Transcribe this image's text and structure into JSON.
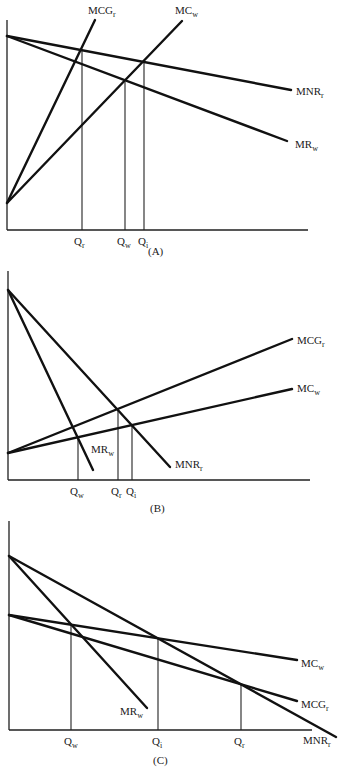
{
  "figure": {
    "panels": [
      {
        "id": "A",
        "caption": "(A)",
        "caption_pos": [
          148,
          255
        ],
        "axes": {
          "origin": [
            7,
            230
          ],
          "y_top": 20,
          "x_end": 308
        },
        "curves": [
          {
            "name": "MNR",
            "sub": "r",
            "from": [
              7,
              36
            ],
            "to": [
              291,
              90
            ],
            "label_pos": [
              296,
              95
            ]
          },
          {
            "name": "MR",
            "sub": "w",
            "from": [
              7,
              36
            ],
            "to": [
              287,
              141
            ],
            "label_pos": [
              295,
              148
            ]
          },
          {
            "name": "MCG",
            "sub": "r",
            "from": [
              7,
              203
            ],
            "to": [
              95,
              20
            ],
            "label_pos": [
              88,
              14
            ]
          },
          {
            "name": "MC",
            "sub": "w",
            "from": [
              7,
              203
            ],
            "to": [
              182,
              21
            ],
            "label_pos": [
              175,
              14
            ]
          }
        ],
        "drops": [
          {
            "x": 82,
            "y_top": 50,
            "name": "Q",
            "sub": "r",
            "label_pos": [
              74,
              245
            ]
          },
          {
            "x": 125,
            "y_top": 82,
            "name": "Q",
            "sub": "w",
            "label_pos": [
              117,
              245
            ]
          },
          {
            "x": 144,
            "y_top": 63,
            "name": "Q",
            "sub": "i",
            "label_pos": [
              138,
              245
            ]
          }
        ]
      },
      {
        "id": "B",
        "caption": "(B)",
        "caption_pos": [
          150,
          512
        ],
        "axes": {
          "origin": [
            8,
            480
          ],
          "y_top": 271,
          "x_end": 310
        },
        "curves": [
          {
            "name": "MR",
            "sub": "w",
            "from": [
              8,
              290
            ],
            "to": [
              93,
              470
            ],
            "label_pos": [
              91,
              453
            ]
          },
          {
            "name": "MNR",
            "sub": "r",
            "from": [
              8,
              290
            ],
            "to": [
              170,
              467
            ],
            "label_pos": [
              175,
              468
            ]
          },
          {
            "name": "MCG",
            "sub": "r",
            "from": [
              8,
              453
            ],
            "to": [
              292,
              339
            ],
            "label_pos": [
              297,
              344
            ]
          },
          {
            "name": "MC",
            "sub": "w",
            "from": [
              8,
              453
            ],
            "to": [
              292,
              389
            ],
            "label_pos": [
              297,
              392
            ]
          }
        ],
        "drops": [
          {
            "x": 78,
            "y_top": 437,
            "name": "Q",
            "sub": "w",
            "label_pos": [
              70,
              495
            ]
          },
          {
            "x": 118,
            "y_top": 409,
            "name": "Q",
            "sub": "r",
            "label_pos": [
              111,
              495
            ]
          },
          {
            "x": 132,
            "y_top": 424,
            "name": "Q",
            "sub": "i",
            "label_pos": [
              126,
              495
            ]
          }
        ]
      },
      {
        "id": "C",
        "caption": "(C)",
        "caption_pos": [
          153,
          764
        ],
        "axes": {
          "origin": [
            9,
            730
          ],
          "y_top": 521,
          "x_end": 312
        },
        "curves": [
          {
            "name": "MR",
            "sub": "w",
            "from": [
              9,
              556
            ],
            "to": [
              147,
              708
            ],
            "label_pos": [
              120,
              715
            ]
          },
          {
            "name": "MNR",
            "sub": "r",
            "from": [
              9,
              556
            ],
            "to": [
              336,
              737
            ],
            "label_pos": [
              303,
              744
            ]
          },
          {
            "name": "MC",
            "sub": "w",
            "from": [
              9,
              615
            ],
            "to": [
              297,
              660
            ],
            "label_pos": [
              301,
              667
            ]
          },
          {
            "name": "MCG",
            "sub": "r",
            "from": [
              9,
              615
            ],
            "to": [
              297,
              701
            ],
            "label_pos": [
              301,
              708
            ]
          }
        ],
        "drops": [
          {
            "x": 71,
            "y_top": 625,
            "name": "Q",
            "sub": "w",
            "label_pos": [
              64,
              745
            ]
          },
          {
            "x": 158,
            "y_top": 639,
            "name": "Q",
            "sub": "i",
            "label_pos": [
              152,
              745
            ]
          },
          {
            "x": 241,
            "y_top": 685,
            "name": "Q",
            "sub": "r",
            "label_pos": [
              234,
              745
            ]
          }
        ]
      }
    ]
  }
}
